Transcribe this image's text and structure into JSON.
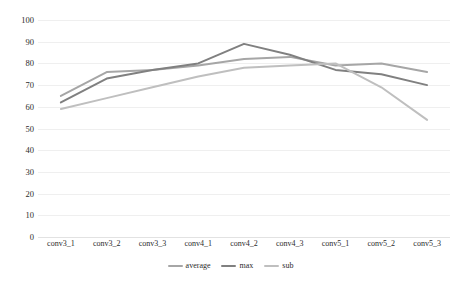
{
  "chart_data": {
    "type": "line",
    "title": "",
    "xlabel": "",
    "ylabel": "",
    "ylim": [
      0,
      100
    ],
    "ytick_step": 10,
    "yticks": [
      "100",
      "90",
      "80",
      "70",
      "60",
      "50",
      "40",
      "30",
      "20",
      "10",
      "0"
    ],
    "grid": true,
    "legend_position": "bottom-center",
    "categories": [
      "conv3_1",
      "conv3_2",
      "conv3_3",
      "conv4_1",
      "conv4_2",
      "conv4_3",
      "conv5_1",
      "conv5_2",
      "conv5_3"
    ],
    "series": [
      {
        "name": "average",
        "color": "#a6a6a6",
        "values": [
          65,
          76,
          77,
          79,
          82,
          83,
          79,
          80,
          76
        ]
      },
      {
        "name": "max",
        "color": "#808080",
        "values": [
          62,
          73,
          77,
          80,
          89,
          84,
          77,
          75,
          70
        ]
      },
      {
        "name": "sub",
        "color": "#bfbfbf",
        "values": [
          59,
          64,
          69,
          74,
          78,
          79,
          80,
          69,
          54
        ]
      }
    ]
  },
  "legend": {
    "items": [
      {
        "label": "average"
      },
      {
        "label": "max"
      },
      {
        "label": "sub"
      }
    ]
  }
}
